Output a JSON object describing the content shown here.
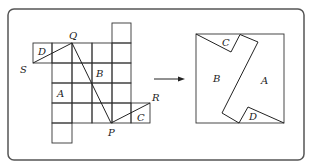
{
  "figure": {
    "left_panel": {
      "vertex_labels": {
        "Q": "Q",
        "S": "S",
        "P": "P",
        "R": "R"
      },
      "piece_labels": {
        "A": "A",
        "B": "B",
        "C": "C",
        "D": "D"
      }
    },
    "right_panel": {
      "piece_labels": {
        "A": "A",
        "B": "B",
        "C": "C",
        "D": "D"
      }
    },
    "arrow": "right-arrow"
  }
}
